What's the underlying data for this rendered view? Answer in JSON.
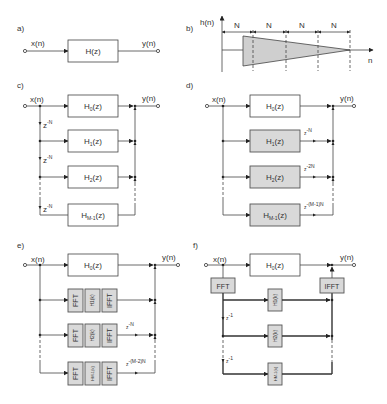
{
  "panels": {
    "a": {
      "label": "a)",
      "input": "x(n)",
      "output": "y(n)",
      "block": "H(z)"
    },
    "b": {
      "label": "b)",
      "yaxis": "h(n)",
      "xaxis": "n",
      "segments": [
        "N",
        "N",
        "N",
        "N"
      ]
    },
    "c": {
      "label": "c)",
      "input": "x(n)",
      "output": "y(n)",
      "blocks": [
        "H0(z)",
        "H1(z)",
        "H2(z)",
        "HM-1(z)"
      ],
      "delays": [
        "z-N",
        "z-N",
        "z-N"
      ]
    },
    "d": {
      "label": "d)",
      "input": "x(n)",
      "output": "y(n)",
      "blocks": [
        "H0(z)",
        "H1(z)",
        "H2(z)",
        "HM-1(z)"
      ],
      "delays": [
        "z-N",
        "z-2N",
        "z-(M-1)N"
      ]
    },
    "e": {
      "label": "e)",
      "input": "x(n)",
      "output": "y(n)",
      "block": "H0(z)",
      "rows": [
        {
          "fft": "FFT",
          "h": "H1(k)",
          "ifft": "IFFT",
          "delay": ""
        },
        {
          "fft": "FFT",
          "h": "H2(k)",
          "ifft": "IFFT",
          "delay": "z-N"
        },
        {
          "fft": "FFT",
          "h": "HM-1(k)",
          "ifft": "IFFT",
          "delay": "z-(M-2)N"
        }
      ]
    },
    "f": {
      "label": "f)",
      "input": "x(n)",
      "output": "y(n)",
      "block": "H0(z)",
      "fft": "FFT",
      "ifft": "IFFT",
      "rows": [
        "H1(k)",
        "H2(k)",
        "HM-1(k)"
      ],
      "delays": [
        "z-1",
        "z-1"
      ]
    }
  },
  "text": {
    "a_label": "a)",
    "b_label": "b)",
    "c_label": "c)",
    "d_label": "d)",
    "e_label": "e)",
    "f_label": "f)",
    "xn": "x(n)",
    "yn": "y(n)",
    "hn": "h(n)",
    "n": "n",
    "N": "N",
    "Hz": "H(z)",
    "H": "H",
    "z": "(z)",
    "k": "(k)",
    "s0": "0",
    "s1": "1",
    "s2": "2",
    "sM1": "M-1",
    "z_base": "z",
    "e_negN": "-N",
    "e_neg2N": "-2N",
    "e_negM1N": "-(M-1)N",
    "e_negM2N": "-(M-2)N",
    "e_neg1": "-1",
    "FFT": "FFT",
    "IFFT": "IFFT"
  }
}
